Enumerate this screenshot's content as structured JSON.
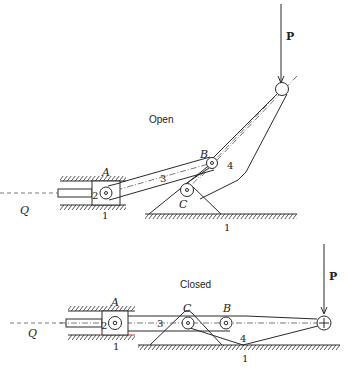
{
  "figure": {
    "open": {
      "state_label": "Open",
      "force_label": "P",
      "input_label": "Q",
      "joint_labels": {
        "A": "A",
        "B": "B",
        "C": "C"
      },
      "link_labels": {
        "frame": "1",
        "frame_ground": "1",
        "slider": "2",
        "coupler": "3",
        "lever": "4"
      }
    },
    "closed": {
      "state_label": "Closed",
      "force_label": "P",
      "input_label": "Q",
      "joint_labels": {
        "A": "A",
        "B": "B",
        "C": "C"
      },
      "link_labels": {
        "frame": "1",
        "frame_ground": "1",
        "slider": "2",
        "coupler": "3",
        "lever": "4"
      }
    },
    "colors": {
      "line": "#2a2a2a",
      "highlight": "#d03030",
      "background": "#ffffff"
    }
  }
}
